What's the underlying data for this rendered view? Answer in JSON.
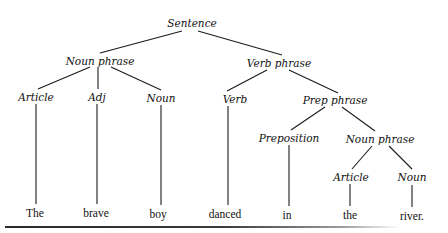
{
  "diagram": {
    "type": "parse-tree",
    "nodes": [
      {
        "id": "s",
        "label": "Sentence",
        "kind": "phrase",
        "x": 192,
        "y": 23
      },
      {
        "id": "np1",
        "label": "Noun phrase",
        "kind": "phrase",
        "x": 100,
        "y": 61
      },
      {
        "id": "vp",
        "label": "Verb phrase",
        "kind": "phrase",
        "x": 279,
        "y": 63
      },
      {
        "id": "art1",
        "label": "Article",
        "kind": "phrase",
        "x": 36,
        "y": 97
      },
      {
        "id": "adj",
        "label": "Adj",
        "kind": "phrase",
        "x": 97,
        "y": 97
      },
      {
        "id": "n1",
        "label": "Noun",
        "kind": "phrase",
        "x": 161,
        "y": 98
      },
      {
        "id": "v",
        "label": "Verb",
        "kind": "phrase",
        "x": 235,
        "y": 99
      },
      {
        "id": "pp",
        "label": "Prep phrase",
        "kind": "phrase",
        "x": 335,
        "y": 100
      },
      {
        "id": "prep",
        "label": "Preposition",
        "kind": "phrase",
        "x": 289,
        "y": 138
      },
      {
        "id": "np2",
        "label": "Noun phrase",
        "kind": "phrase",
        "x": 380,
        "y": 139
      },
      {
        "id": "art2",
        "label": "Article",
        "kind": "phrase",
        "x": 351,
        "y": 177
      },
      {
        "id": "n2",
        "label": "Noun",
        "kind": "phrase",
        "x": 412,
        "y": 177
      },
      {
        "id": "w1",
        "label": "The",
        "kind": "word",
        "x": 35,
        "y": 213
      },
      {
        "id": "w2",
        "label": "brave",
        "kind": "word",
        "x": 96,
        "y": 213
      },
      {
        "id": "w3",
        "label": "boy",
        "kind": "word",
        "x": 158,
        "y": 214
      },
      {
        "id": "w4",
        "label": "danced",
        "kind": "word",
        "x": 225,
        "y": 214
      },
      {
        "id": "w5",
        "label": "in",
        "kind": "word",
        "x": 287,
        "y": 215
      },
      {
        "id": "w6",
        "label": "the",
        "kind": "word",
        "x": 350,
        "y": 215
      },
      {
        "id": "w7",
        "label": "river.",
        "kind": "word",
        "x": 412,
        "y": 216
      }
    ],
    "edges": [
      {
        "from": "s",
        "to": "np1",
        "x1": 182,
        "y1": 31,
        "x2": 100,
        "y2": 53
      },
      {
        "from": "s",
        "to": "vp",
        "x1": 198,
        "y1": 31,
        "x2": 282,
        "y2": 55
      },
      {
        "from": "np1",
        "to": "art1",
        "x1": 90,
        "y1": 67,
        "x2": 38,
        "y2": 89
      },
      {
        "from": "np1",
        "to": "adj",
        "x1": 98,
        "y1": 67,
        "x2": 98,
        "y2": 89
      },
      {
        "from": "np1",
        "to": "n1",
        "x1": 111,
        "y1": 67,
        "x2": 161,
        "y2": 90
      },
      {
        "from": "vp",
        "to": "v",
        "x1": 267,
        "y1": 70,
        "x2": 227,
        "y2": 91
      },
      {
        "from": "vp",
        "to": "pp",
        "x1": 289,
        "y1": 70,
        "x2": 338,
        "y2": 93
      },
      {
        "from": "pp",
        "to": "prep",
        "x1": 325,
        "y1": 107,
        "x2": 291,
        "y2": 130
      },
      {
        "from": "pp",
        "to": "np2",
        "x1": 342,
        "y1": 107,
        "x2": 375,
        "y2": 131
      },
      {
        "from": "np2",
        "to": "art2",
        "x1": 372,
        "y1": 146,
        "x2": 352,
        "y2": 169
      },
      {
        "from": "np2",
        "to": "n2",
        "x1": 389,
        "y1": 146,
        "x2": 412,
        "y2": 169
      },
      {
        "from": "art1",
        "to": "w1",
        "x1": 36,
        "y1": 104,
        "x2": 36,
        "y2": 204
      },
      {
        "from": "adj",
        "to": "w2",
        "x1": 97,
        "y1": 104,
        "x2": 97,
        "y2": 204
      },
      {
        "from": "n1",
        "to": "w3",
        "x1": 161,
        "y1": 105,
        "x2": 161,
        "y2": 205
      },
      {
        "from": "v",
        "to": "w4",
        "x1": 228,
        "y1": 106,
        "x2": 228,
        "y2": 205
      },
      {
        "from": "prep",
        "to": "w5",
        "x1": 289,
        "y1": 145,
        "x2": 289,
        "y2": 206
      },
      {
        "from": "art2",
        "to": "w6",
        "x1": 350,
        "y1": 184,
        "x2": 350,
        "y2": 206
      },
      {
        "from": "n2",
        "to": "w7",
        "x1": 412,
        "y1": 185,
        "x2": 412,
        "y2": 207
      }
    ],
    "sentence": [
      "The",
      "brave",
      "boy",
      "danced",
      "in",
      "the",
      "river."
    ]
  }
}
